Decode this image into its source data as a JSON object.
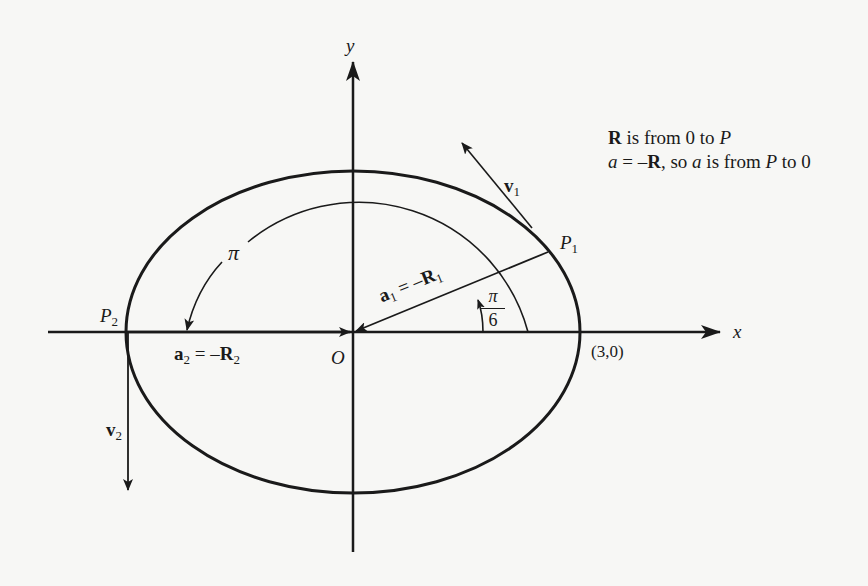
{
  "diagram": {
    "axes": {
      "x_label": "x",
      "y_label": "y",
      "origin_label": "O"
    },
    "points": {
      "p1": {
        "name": "P",
        "sub": "1"
      },
      "p2": {
        "name": "P",
        "sub": "2"
      },
      "x_intercept": "(3,0)"
    },
    "vectors": {
      "v1": {
        "name": "v",
        "sub": "1"
      },
      "v2": {
        "name": "v",
        "sub": "2"
      },
      "a1": {
        "lhs": "a",
        "lhs_sub": "1",
        "eq": " = –",
        "rhs": "R",
        "rhs_sub": "1"
      },
      "a2": {
        "lhs": "a",
        "lhs_sub": "2",
        "eq": " = –",
        "rhs": "R",
        "rhs_sub": "2"
      }
    },
    "angles": {
      "small": {
        "num": "π",
        "den": "6"
      },
      "large": "π"
    },
    "note": {
      "line1_bold": "R",
      "line1_rest": " is from 0 to ",
      "line1_end": "P",
      "line2_a": "a",
      "line2_eq": " = –",
      "line2_R": "R",
      "line2_mid": ", so ",
      "line2_a2": "a",
      "line2_rest": " is from ",
      "line2_P": "P",
      "line2_end": " to 0"
    }
  }
}
